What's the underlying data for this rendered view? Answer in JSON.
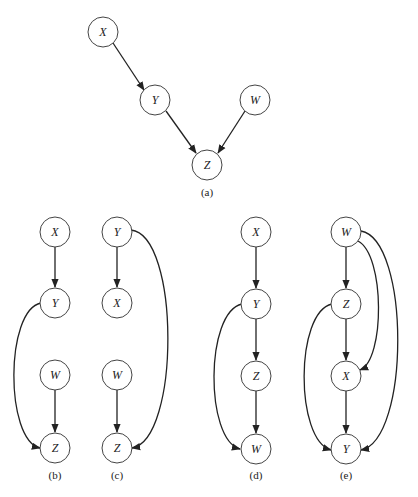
{
  "diagram": {
    "type": "directed-graphs",
    "panels": [
      {
        "id": "a",
        "caption": "(a)",
        "nodes": [
          {
            "label": "X"
          },
          {
            "label": "Y"
          },
          {
            "label": "W"
          },
          {
            "label": "Z"
          }
        ],
        "edges": [
          [
            "X",
            "Y"
          ],
          [
            "Y",
            "Z"
          ],
          [
            "W",
            "Z"
          ]
        ]
      },
      {
        "id": "b",
        "caption": "(b)",
        "nodes": [
          {
            "label": "X"
          },
          {
            "label": "Y"
          },
          {
            "label": "W"
          },
          {
            "label": "Z"
          }
        ],
        "edges": [
          [
            "X",
            "Y"
          ],
          [
            "Y",
            "Z"
          ],
          [
            "W",
            "Z"
          ]
        ]
      },
      {
        "id": "c",
        "caption": "(c)",
        "nodes": [
          {
            "label": "Y"
          },
          {
            "label": "X"
          },
          {
            "label": "W"
          },
          {
            "label": "Z"
          }
        ],
        "edges": [
          [
            "Y",
            "X"
          ],
          [
            "Y",
            "Z"
          ],
          [
            "W",
            "Z"
          ]
        ]
      },
      {
        "id": "d",
        "caption": "(d)",
        "nodes": [
          {
            "label": "X"
          },
          {
            "label": "Y"
          },
          {
            "label": "Z"
          },
          {
            "label": "W"
          }
        ],
        "edges": [
          [
            "X",
            "Y"
          ],
          [
            "Y",
            "Z"
          ],
          [
            "Z",
            "W"
          ],
          [
            "Y",
            "W"
          ]
        ]
      },
      {
        "id": "e",
        "caption": "(e)",
        "nodes": [
          {
            "label": "W"
          },
          {
            "label": "Z"
          },
          {
            "label": "X"
          },
          {
            "label": "Y"
          }
        ],
        "edges": [
          [
            "W",
            "Z"
          ],
          [
            "Z",
            "X"
          ],
          [
            "X",
            "Y"
          ],
          [
            "W",
            "X"
          ],
          [
            "W",
            "Y"
          ],
          [
            "Z",
            "Y"
          ]
        ]
      }
    ]
  }
}
